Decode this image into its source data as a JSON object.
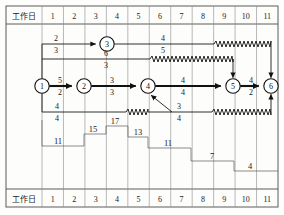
{
  "table": {
    "row_header_label": "工作日",
    "day_columns": [
      "1",
      "2",
      "3",
      "4",
      "5",
      "6",
      "7",
      "8",
      "9",
      "10",
      "11"
    ],
    "header_top_label": "工作日",
    "header_bottom_label": "工作日"
  },
  "chart_data": {
    "type": "diagram",
    "xlabel": "工作日",
    "x_ticks": [
      "1",
      "2",
      "3",
      "4",
      "5",
      "6",
      "7",
      "8",
      "9",
      "10",
      "11"
    ],
    "nodes": [
      {
        "id": "1",
        "label": "1",
        "day": 1
      },
      {
        "id": "2",
        "label": "2",
        "day": 2
      },
      {
        "id": "3",
        "label": "3",
        "day": 3
      },
      {
        "id": "4",
        "label": "4",
        "day": 5
      },
      {
        "id": "5",
        "label": "5",
        "day": 9
      },
      {
        "id": "6",
        "label": "6",
        "day": 11
      }
    ],
    "edges": [
      {
        "from": "1",
        "to": "3",
        "upper": "2",
        "lower": "3",
        "critical": false
      },
      {
        "from": "3",
        "to": "6",
        "upper": "4",
        "lower": "5",
        "critical": false
      },
      {
        "from": "1",
        "to": "4",
        "upper": "6",
        "lower": "3",
        "critical": false
      },
      {
        "from": "1",
        "to": "2",
        "upper": "5",
        "lower": "2",
        "critical": true
      },
      {
        "from": "2",
        "to": "4",
        "upper": "3",
        "lower": "3",
        "critical": true
      },
      {
        "from": "4",
        "to": "5",
        "upper": "4",
        "lower": "4",
        "critical": true
      },
      {
        "from": "5",
        "to": "6",
        "upper": "4",
        "lower": "2",
        "critical": true
      },
      {
        "from": "1",
        "to": "6",
        "upper": "4",
        "lower": "4",
        "critical": false
      },
      {
        "from": "4",
        "to": "6",
        "upper": "3",
        "lower": "4",
        "critical": false
      }
    ],
    "step_labels": [
      "11",
      "15",
      "17",
      "13",
      "11",
      "7",
      "4"
    ],
    "edge_duration_labels": [
      "2",
      "3",
      "4",
      "5",
      "6",
      "3",
      "5",
      "2",
      "3",
      "3",
      "4",
      "4",
      "4",
      "2",
      "4",
      "4",
      "3",
      "4"
    ]
  },
  "colors": {
    "grid": "#8a8a8a",
    "line": "#1a1a1a",
    "critical": "#111111",
    "background": "#fdfdfc"
  }
}
